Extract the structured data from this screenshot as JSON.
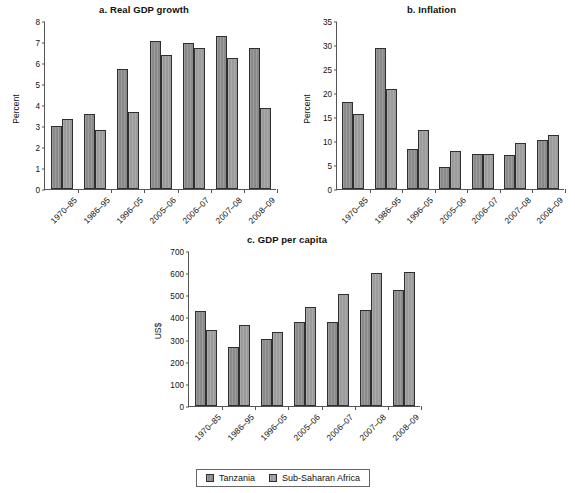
{
  "figure": {
    "background": "#ffffff",
    "series_colors": [
      "#8a8a8a",
      "#9b9b9b"
    ]
  },
  "legend": {
    "position": "bottom-center",
    "entries": [
      {
        "label": "Tanzania",
        "color": "#8a8a8a"
      },
      {
        "label": "Sub-Saharan Africa",
        "color": "#9b9b9b"
      }
    ]
  },
  "chart_data": [
    {
      "type": "bar",
      "id": "a",
      "title": "a. Real GDP growth",
      "xlabel": "",
      "ylabel": "Percent",
      "ylim": [
        0,
        8
      ],
      "yticks": [
        0,
        1,
        2,
        3,
        4,
        5,
        6,
        7,
        8
      ],
      "grid": false,
      "legend_position": "figure-bottom",
      "categories": [
        "1970–85",
        "1986–95",
        "1996–05",
        "2005–06",
        "2006–07",
        "2007–08",
        "2008–09"
      ],
      "series": [
        {
          "name": "Tanzania",
          "values": [
            3.0,
            3.55,
            5.7,
            7.05,
            6.95,
            7.3,
            6.7
          ]
        },
        {
          "name": "Sub-Saharan Africa",
          "values": [
            3.35,
            2.8,
            3.65,
            6.4,
            6.7,
            6.25,
            3.85
          ]
        }
      ]
    },
    {
      "type": "bar",
      "id": "b",
      "title": "b. Inflation",
      "xlabel": "",
      "ylabel": "Percent",
      "ylim": [
        0,
        35
      ],
      "yticks": [
        0,
        5,
        10,
        15,
        20,
        25,
        30,
        35
      ],
      "grid": false,
      "legend_position": "figure-bottom",
      "categories": [
        "1970–85",
        "1986–95",
        "1996–05",
        "2005–06",
        "2006–07",
        "2007–08",
        "2008–09"
      ],
      "series": [
        {
          "name": "Tanzania",
          "values": [
            18.2,
            29.4,
            8.3,
            4.5,
            7.2,
            7.0,
            10.3
          ]
        },
        {
          "name": "Sub-Saharan Africa",
          "values": [
            15.7,
            20.9,
            12.2,
            8.0,
            7.2,
            9.5,
            11.2
          ]
        }
      ]
    },
    {
      "type": "bar",
      "id": "c",
      "title": "c. GDP per capita",
      "xlabel": "",
      "ylabel": "US$",
      "ylim": [
        0,
        700
      ],
      "yticks": [
        0,
        100,
        200,
        300,
        400,
        500,
        600,
        700
      ],
      "grid": false,
      "legend_position": "figure-bottom",
      "categories": [
        "1970–85",
        "1986–95",
        "1996–05",
        "2005–06",
        "2006–07",
        "2007–08",
        "2008–09"
      ],
      "series": [
        {
          "name": "Tanzania",
          "values": [
            428,
            267,
            302,
            378,
            379,
            433,
            522
          ]
        },
        {
          "name": "Sub-Saharan Africa",
          "values": [
            345,
            367,
            335,
            446,
            506,
            602,
            605
          ]
        }
      ]
    }
  ]
}
